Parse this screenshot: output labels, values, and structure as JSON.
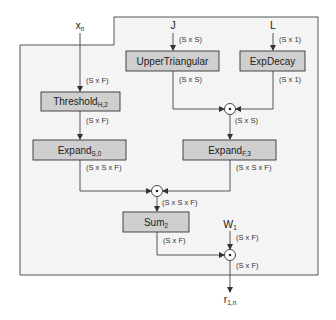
{
  "colors": {
    "background": "#ffffff",
    "region_fill": "#f4f4f4",
    "region_stroke": "#555555",
    "box_fill": "#cfcfcf",
    "box_stroke": "#333333",
    "line": "#444444"
  },
  "inputs": {
    "x": {
      "base": "x",
      "sub": "n"
    },
    "J": {
      "base": "J"
    },
    "L": {
      "base": "L"
    },
    "W": {
      "base": "W",
      "sub": "1"
    }
  },
  "output": {
    "base": "r",
    "sub": "1,n"
  },
  "nodes": {
    "threshold": {
      "base": "Threshold",
      "sub": "H,2"
    },
    "expand_s": {
      "base": "Expand",
      "sub": "S,0"
    },
    "upper_triangular": {
      "base": "UpperTriangular"
    },
    "exp_decay": {
      "base": "ExpDecay"
    },
    "expand_f": {
      "base": "Expand",
      "sub": "F,3"
    },
    "sum": {
      "base": "Sum",
      "sub": "2"
    }
  },
  "operator_symbol": "⊙",
  "dims": {
    "x_in": "(S x F)",
    "threshold_out": "(S x F)",
    "expand_s_out": "(S x S x F)",
    "J_in": "(S x S)",
    "upper_out": "(S x S)",
    "L_in": "(S x 1)",
    "exp_out": "(S x 1)",
    "mul1_out": "(S x S)",
    "expand_f_out": "(S x S x F)",
    "mul2_out": "(S x S x F)",
    "sum_out": "(S x F)",
    "W_in": "(S x F)",
    "mul3_out": "(S x F)"
  }
}
